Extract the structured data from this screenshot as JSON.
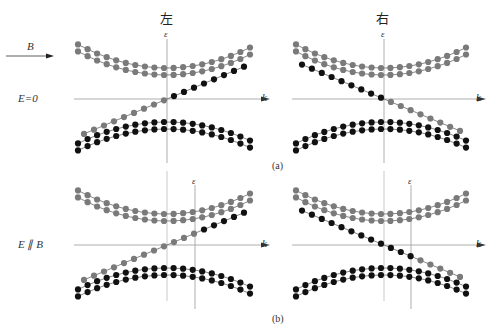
{
  "titles": {
    "left": "左",
    "right": "右"
  },
  "labels": {
    "field_b": "B",
    "row_a": "E=0",
    "row_b": "E ∥ B",
    "axis_energy": "ε",
    "axis_k": "k",
    "caption_a": "(a)",
    "caption_b": "(b)"
  },
  "colors": {
    "upper_band": "#7a7a7a",
    "lower_band": "#111111",
    "axis": "#999999",
    "line": "#555555"
  },
  "panels": [
    {
      "id": "a-left",
      "center_x": 167,
      "axis_y": 99,
      "eps_x": 167,
      "chiral": -1,
      "x_min": 78,
      "x_max": 250
    },
    {
      "id": "a-right",
      "center_x": 384,
      "axis_y": 99,
      "eps_x": 384,
      "chiral": 1,
      "x_min": 296,
      "x_max": 466
    },
    {
      "id": "b-left",
      "center_x": 167,
      "axis_y": 245,
      "eps_x": 195,
      "chiral": -1,
      "x_min": 78,
      "x_max": 250
    },
    {
      "id": "b-right",
      "center_x": 384,
      "axis_y": 245,
      "eps_x": 411,
      "chiral": 1,
      "x_min": 296,
      "x_max": 466
    }
  ]
}
